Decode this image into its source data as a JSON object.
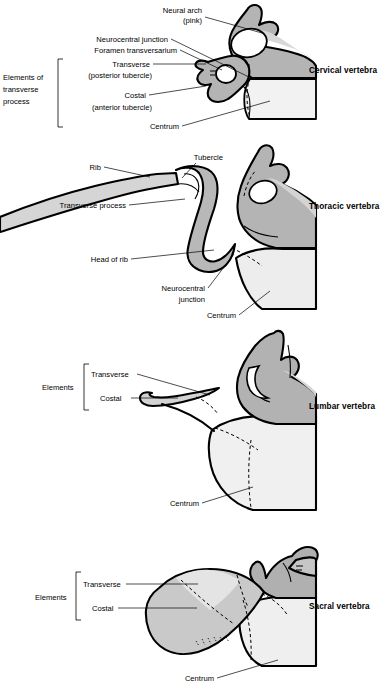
{
  "figure": {
    "background": "#ffffff",
    "colors": {
      "neural_arch_gray": "#b2b2b2",
      "costal_gray": "#cfcfcf",
      "centrum_light": "#f0f0f0",
      "transverse_light": "#e2e2e2",
      "outline": "#000000",
      "text": "#000000"
    }
  },
  "panels": [
    {
      "id": "cervical",
      "title": "Cervical vertebra",
      "bracket_label_lines": [
        "Elements of",
        "transverse",
        "process"
      ],
      "labels": [
        {
          "id": "neural-arch",
          "lines": [
            "Neural arch",
            "(pink)"
          ]
        },
        {
          "id": "neurocentral-junction",
          "lines": [
            "Neurocentral junction"
          ]
        },
        {
          "id": "foramen-transversarium",
          "lines": [
            "Foramen transversarium"
          ]
        },
        {
          "id": "transverse",
          "lines": [
            "Transverse",
            "(posterior tubercle)"
          ]
        },
        {
          "id": "costal",
          "lines": [
            "Costal",
            "(anterior tubercle)"
          ]
        },
        {
          "id": "centrum",
          "lines": [
            "Centrum"
          ]
        }
      ]
    },
    {
      "id": "thoracic",
      "title": "Thoracic vertebra",
      "bracket_label_lines": [],
      "labels": [
        {
          "id": "tubercle",
          "lines": [
            "Tubercle"
          ]
        },
        {
          "id": "rib",
          "lines": [
            "Rib"
          ]
        },
        {
          "id": "transverse-process",
          "lines": [
            "Transverse process"
          ]
        },
        {
          "id": "head-of-rib",
          "lines": [
            "Head of rib"
          ]
        },
        {
          "id": "neurocentral-junction",
          "lines": [
            "Neurocentral",
            "junction"
          ]
        },
        {
          "id": "centrum",
          "lines": [
            "Centrum"
          ]
        }
      ]
    },
    {
      "id": "lumbar",
      "title": "Lumbar vertebra",
      "bracket_label_lines": [
        "Elements"
      ],
      "labels": [
        {
          "id": "transverse",
          "lines": [
            "Transverse"
          ]
        },
        {
          "id": "costal",
          "lines": [
            "Costal"
          ]
        },
        {
          "id": "centrum",
          "lines": [
            "Centrum"
          ]
        }
      ]
    },
    {
      "id": "sacral",
      "title": "Sacral vertebra",
      "bracket_label_lines": [
        "Elements"
      ],
      "labels": [
        {
          "id": "transverse",
          "lines": [
            "Transverse"
          ]
        },
        {
          "id": "costal",
          "lines": [
            "Costal"
          ]
        },
        {
          "id": "centrum",
          "lines": [
            "Centrum"
          ]
        }
      ]
    }
  ],
  "text": {
    "cervical": {
      "title": "Cervical vertebra",
      "neural_arch_1": "Neural arch",
      "neural_arch_2": "(pink)",
      "neurocentral_junction": "Neurocentral junction",
      "foramen_transversarium": "Foramen transversarium",
      "transverse": "Transverse",
      "transverse_sub": "(posterior tubercle)",
      "costal": "Costal",
      "costal_sub": "(anterior tubercle)",
      "centrum": "Centrum",
      "elements_1": "Elements of",
      "elements_2": "transverse",
      "elements_3": "process"
    },
    "thoracic": {
      "title": "Thoracic vertebra",
      "tubercle": "Tubercle",
      "rib": "Rib",
      "transverse_process": "Transverse process",
      "head_of_rib": "Head of rib",
      "neurocentral_1": "Neurocentral",
      "neurocentral_2": "junction",
      "centrum": "Centrum"
    },
    "lumbar": {
      "title": "Lumbar vertebra",
      "elements": "Elements",
      "transverse": "Transverse",
      "costal": "Costal",
      "centrum": "Centrum"
    },
    "sacral": {
      "title": "Sacral vertebra",
      "elements": "Elements",
      "transverse": "Transverse",
      "costal": "Costal",
      "centrum": "Centrum"
    }
  }
}
